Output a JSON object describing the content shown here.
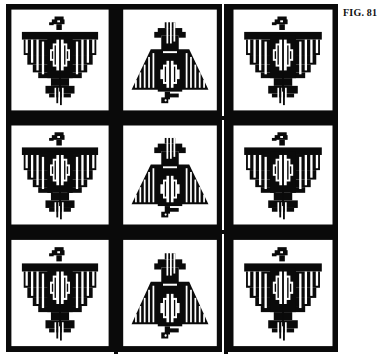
{
  "figure": {
    "caption": "FIG. 81",
    "colors": {
      "ink": "#0a0a0a",
      "paper": "#ffffff"
    },
    "grid": {
      "rows": 3,
      "cols": 3,
      "tiles": [
        {
          "row": 0,
          "col": 0,
          "motif": "thunderbird-spread"
        },
        {
          "row": 0,
          "col": 1,
          "motif": "thunderbird-folded"
        },
        {
          "row": 0,
          "col": 2,
          "motif": "thunderbird-spread"
        },
        {
          "row": 1,
          "col": 0,
          "motif": "thunderbird-spread"
        },
        {
          "row": 1,
          "col": 1,
          "motif": "thunderbird-folded"
        },
        {
          "row": 1,
          "col": 2,
          "motif": "thunderbird-spread"
        },
        {
          "row": 2,
          "col": 0,
          "motif": "thunderbird-spread"
        },
        {
          "row": 2,
          "col": 1,
          "motif": "thunderbird-folded"
        },
        {
          "row": 2,
          "col": 2,
          "motif": "thunderbird-spread"
        }
      ]
    }
  }
}
